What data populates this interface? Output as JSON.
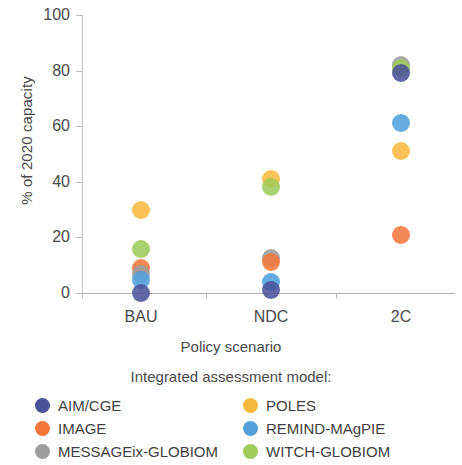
{
  "chart_data": {
    "type": "scatter",
    "title": "",
    "xlabel": "Policy scenario",
    "ylabel": "% of 2020 capacity",
    "categories": [
      "BAU",
      "NDC",
      "2C"
    ],
    "ylim": [
      0,
      100
    ],
    "yticks": [
      0,
      20,
      40,
      60,
      80,
      100
    ],
    "ytick_labels": [
      "0",
      "20",
      "40",
      "60",
      "80",
      "100"
    ],
    "grid": false,
    "legend_position": "bottom",
    "legend_title": "Integrated assessment model:",
    "series": [
      {
        "name": "AIM/CGE",
        "color": "#4b5398",
        "values": [
          0,
          1,
          79
        ]
      },
      {
        "name": "IMAGE",
        "color": "#f4763c",
        "values": [
          9,
          11,
          21
        ]
      },
      {
        "name": "MESSAGEix-GLOBIOM",
        "color": "#9d9d9d",
        "values": [
          7,
          12.5,
          82
        ]
      },
      {
        "name": "POLES",
        "color": "#f9b93f",
        "values": [
          30,
          41,
          51
        ]
      },
      {
        "name": "REMIND-MAgPIE",
        "color": "#51a0dc",
        "values": [
          4.5,
          4,
          61
        ]
      },
      {
        "name": "WITCH-GLOBIOM",
        "color": "#9ecb5b",
        "values": [
          16,
          38,
          81
        ]
      }
    ]
  },
  "axis": {
    "x_title": "Policy scenario",
    "y_title": "% of 2020 capacity"
  },
  "legend": {
    "title": "Integrated assessment model:",
    "entries": [
      {
        "label": "AIM/CGE",
        "color": "#4b5398"
      },
      {
        "label": "POLES",
        "color": "#f9b93f"
      },
      {
        "label": "IMAGE",
        "color": "#f4763c"
      },
      {
        "label": "REMIND-MAgPIE",
        "color": "#51a0dc"
      },
      {
        "label": "MESSAGEix-GLOBIOM",
        "color": "#9d9d9d"
      },
      {
        "label": "WITCH-GLOBIOM",
        "color": "#9ecb5b"
      }
    ]
  }
}
